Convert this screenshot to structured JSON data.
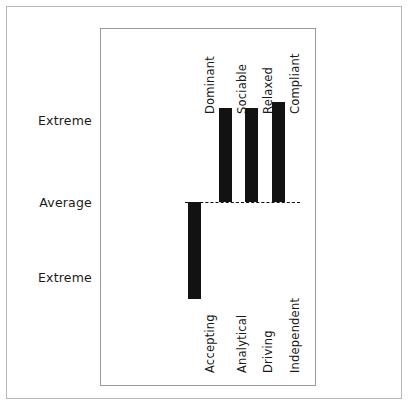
{
  "figure": {
    "background_color": "#ffffff",
    "outer_border_color": "#b8b8b8",
    "panel_border_color": "#9a9a9a",
    "bar_color": "#121212",
    "baseline_color": "#111111"
  },
  "axis": {
    "scale_labels": {
      "top": "Extreme",
      "middle": "Average",
      "bottom": "Extreme"
    }
  },
  "chart_data": {
    "type": "bar",
    "title": "",
    "subtitle": "",
    "xlabel": "",
    "ylabel": "",
    "orientation": "vertical",
    "baseline": "Average",
    "grid": false,
    "legend": null,
    "ylim": [
      -1,
      1
    ],
    "ytick_labels": [
      "Extreme",
      "Average",
      "Extreme"
    ],
    "ytick_values": [
      1,
      0,
      -1
    ],
    "categories": [
      {
        "top_label": "Dominant",
        "bottom_label": "Accepting",
        "value": -0.62
      },
      {
        "top_label": "Sociable",
        "bottom_label": "Analytical",
        "value": 0.6
      },
      {
        "top_label": "Relaxed",
        "bottom_label": "Driving",
        "value": 0.6
      },
      {
        "top_label": "Compliant",
        "bottom_label": "Independent",
        "value": 0.64
      }
    ],
    "top_pole_labels": [
      "Dominant",
      "Sociable",
      "Relaxed",
      "Compliant"
    ],
    "bottom_pole_labels": [
      "Accepting",
      "Analytical",
      "Driving",
      "Independent"
    ],
    "values": [
      -0.62,
      0.6,
      0.6,
      0.64
    ]
  },
  "geometry": {
    "baseline_y_pct": 48.6,
    "baseline_left_pct": 39.4,
    "baseline_right_pct": 93.0,
    "bar_width_pct": 6.1,
    "bar_centers_pct": [
      43.5,
      58.3,
      70.4,
      83.1
    ],
    "top_label_baseline_pct": 24.0,
    "bottom_label_top_pct": 74.5,
    "scale_label_y_pct": {
      "top": 25.7,
      "middle": 48.6,
      "bottom": 69.6
    }
  }
}
